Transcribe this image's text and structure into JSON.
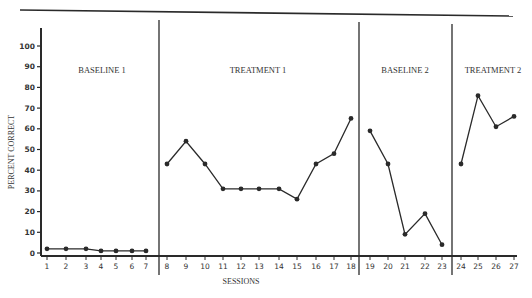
{
  "chart_data": {
    "type": "line",
    "title": "",
    "xlabel": "SESSIONS",
    "ylabel": "PERCENT CORRECT",
    "ylim": [
      0,
      100
    ],
    "yticks": [
      0,
      10,
      20,
      30,
      40,
      50,
      60,
      70,
      80,
      90,
      100
    ],
    "xticks": [
      1,
      2,
      3,
      4,
      5,
      6,
      7,
      8,
      9,
      10,
      11,
      12,
      13,
      14,
      15,
      16,
      17,
      18,
      19,
      20,
      21,
      22,
      23,
      24,
      25,
      26,
      27
    ],
    "grid": false,
    "legend": null,
    "phases": [
      {
        "name": "BASELINE 1",
        "sessions": [
          1,
          2,
          3,
          4,
          5,
          6,
          7
        ],
        "values": [
          2,
          2,
          2,
          1,
          1,
          1,
          1
        ]
      },
      {
        "name": "TREATMENT 1",
        "sessions": [
          8,
          9,
          10,
          11,
          12,
          13,
          14,
          15,
          16,
          17,
          18
        ],
        "values": [
          43,
          54,
          43,
          31,
          31,
          31,
          31,
          26,
          43,
          48,
          65
        ]
      },
      {
        "name": "BASELINE 2",
        "sessions": [
          19,
          20,
          21,
          22,
          23
        ],
        "values": [
          59,
          43,
          9,
          19,
          4
        ]
      },
      {
        "name": "TREATMENT 2",
        "sessions": [
          24,
          25,
          26,
          27
        ],
        "values": [
          43,
          76,
          61,
          66
        ]
      }
    ],
    "annotations": [
      "BASELINE 1",
      "TREATMENT 1",
      "BASELINE 2",
      "TREATMENT 2"
    ]
  },
  "layout": {
    "x_pixel": {
      "1": 47,
      "2": 66,
      "3": 86,
      "4": 101,
      "5": 116,
      "6": 132,
      "7": 146,
      "8": 167,
      "9": 186,
      "10": 205,
      "11": 223,
      "12": 241,
      "13": 259,
      "14": 279,
      "15": 297,
      "16": 316,
      "17": 334,
      "18": 351,
      "19": 370,
      "20": 388,
      "21": 405,
      "22": 425,
      "23": 442,
      "24": 461,
      "25": 478,
      "26": 496,
      "27": 514
    },
    "phase_line_x": [
      159,
      359,
      452
    ],
    "phase_label_x": [
      102,
      258,
      405,
      493
    ]
  },
  "colors": {
    "ink": "#2a2a2a",
    "background": "#ffffff"
  }
}
